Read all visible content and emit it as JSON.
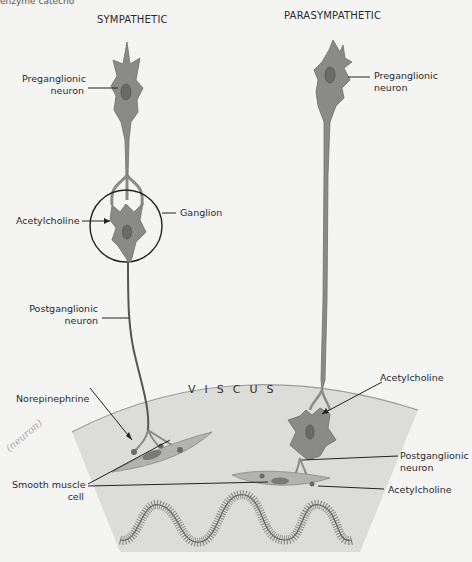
{
  "caption_fragment": "enzyme catecho",
  "headings": {
    "sympathetic": "SYMPATHETIC",
    "parasympathetic": "PARASYMPATHETIC"
  },
  "organ_label": "VISCUS",
  "sympathetic_labels": {
    "preganglionic": [
      "Preganglionic",
      "neuron"
    ],
    "acetylcholine": "Acetylcholine",
    "ganglion": "Ganglion",
    "postganglionic": [
      "Postganglionic",
      "neuron"
    ],
    "norepinephrine": "Norepinephrine",
    "smooth_muscle": [
      "Smooth muscle",
      "cell"
    ]
  },
  "parasympathetic_labels": {
    "preganglionic": [
      "Preganglionic",
      "neuron"
    ],
    "acetylcholine_ganglion": "Acetylcholine",
    "postganglionic": [
      "Postganglionic",
      "neuron"
    ],
    "acetylcholine_effector": "Acetylcholine"
  },
  "handwritten_note": "(neuron)",
  "colors": {
    "neuron_fill": "#8a8a86",
    "neuron_stroke": "#6e6e6a",
    "viscus_fill": "#dcdcd8",
    "viscus_edge": "#9a9a96",
    "muscle_fill": "#b2b2ae",
    "leader_line": "#222222"
  }
}
